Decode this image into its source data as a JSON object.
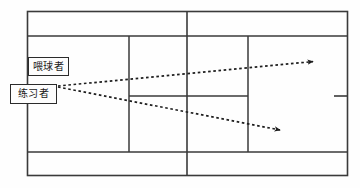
{
  "diagram": {
    "background_color": "#fefefe",
    "line_color": "#3a3a3a",
    "label_border_color": "#2b2b2b",
    "ball_path_color": "#1e1e1e"
  },
  "labels": [
    {
      "id": "feeder",
      "text": "喂球者",
      "name": "ball-feeder-label",
      "x": 28,
      "y": 57,
      "width": 41,
      "height": 19
    },
    {
      "id": "practicer",
      "text": "练习者",
      "name": "practicer-label",
      "x": 10,
      "y": 84,
      "width": 47,
      "height": 20
    }
  ],
  "court": {
    "outer_doubles": {
      "x": 27,
      "y": 11,
      "width": 321,
      "height": 165
    },
    "singles_top_line_y": 36,
    "singles_bottom_line_y": 152,
    "net_line_x": 187,
    "left_service_line_x": 129,
    "right_service_line_x": 248,
    "center_service_line_y": 96,
    "center_mark": {
      "x1": 334,
      "x2": 348,
      "y": 96
    }
  },
  "ball_paths": [
    {
      "id": "path-upper",
      "name": "upper-ball-path",
      "description": "dashed arrow toward deep crosscourt",
      "start_x": 58,
      "start_y": 86,
      "end_x": 318,
      "end_y": 61
    },
    {
      "id": "path-lower",
      "name": "lower-ball-path",
      "description": "dashed arrow toward deep down-the-line",
      "start_x": 58,
      "start_y": 87,
      "end_x": 285,
      "end_y": 131
    }
  ]
}
